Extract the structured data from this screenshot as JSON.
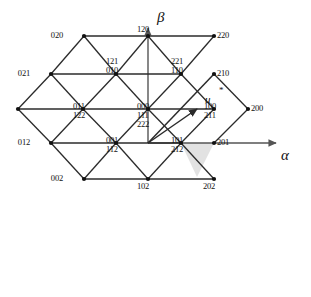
{
  "figure": {
    "type": "triangular-lattice-hexagon",
    "background_color": "#ffffff",
    "line_color": "#2b2b2b",
    "axis_color": "#555555",
    "shaded_sector_color": "#e2e2e2",
    "vertex_color": "#111111"
  },
  "axes": {
    "alpha": {
      "label": "α",
      "x": 281,
      "y": 182,
      "direction": "right"
    },
    "beta": {
      "label": "β",
      "x": 157,
      "y": 10,
      "direction": "up"
    }
  },
  "vector": {
    "label": "u",
    "superscript": "*",
    "label_x": 205,
    "label_y": 128,
    "star_x": 219,
    "star_y": 119,
    "from": [
      148,
      177
    ],
    "to": [
      197,
      143
    ]
  },
  "shaded_sector": {
    "points": "181,143 214,143 197,177",
    "vertices": [
      "110",
      "210",
      "100/211"
    ]
  },
  "lattice": {
    "center": [
      148,
      177
    ],
    "spacing_x": 33,
    "spacing_y": 34,
    "vertices": [
      {
        "id": "v-020",
        "x": 84,
        "y": 70,
        "labels": [
          "020"
        ],
        "lx": 63,
        "ly": 65,
        "align": "right"
      },
      {
        "id": "v-120",
        "x": 148,
        "y": 70,
        "labels": [
          "120"
        ],
        "lx": 137,
        "ly": 59,
        "align": "left"
      },
      {
        "id": "v-220",
        "x": 214,
        "y": 70,
        "labels": [
          "220"
        ],
        "lx": 217,
        "ly": 65,
        "align": "left"
      },
      {
        "id": "v-021",
        "x": 51,
        "y": 108,
        "labels": [
          "021"
        ],
        "lx": 30,
        "ly": 103,
        "align": "right"
      },
      {
        "id": "v-010",
        "x": 116,
        "y": 108,
        "labels": [
          "121",
          "010"
        ],
        "lx": 106,
        "ly": 91,
        "align": "left"
      },
      {
        "id": "v-110",
        "x": 181,
        "y": 108,
        "labels": [
          "221",
          "110"
        ],
        "lx": 171,
        "ly": 91,
        "align": "left"
      },
      {
        "id": "v-210",
        "x": 214,
        "y": 108,
        "labels": [
          "210"
        ],
        "lx": 217,
        "ly": 103,
        "align": "left"
      },
      {
        "id": "v-022",
        "x": 18,
        "y": 143,
        "labels": [
          "022"
        ],
        "lx": -2,
        "ly": 138,
        "align": "right"
      },
      {
        "id": "v-011",
        "x": 83,
        "y": 143,
        "labels": [
          "011",
          "122"
        ],
        "lx": 73,
        "ly": 136,
        "align": "left"
      },
      {
        "id": "v-000",
        "x": 148,
        "y": 143,
        "labels": [
          "000",
          "111",
          "222"
        ],
        "lx": 137,
        "ly": 136,
        "align": "left"
      },
      {
        "id": "v-100",
        "x": 214,
        "y": 143,
        "labels": [
          "100",
          "211"
        ],
        "lx": 204,
        "ly": 136,
        "align": "left"
      },
      {
        "id": "v-200",
        "x": 248,
        "y": 143,
        "labels": [
          "200"
        ],
        "lx": 251,
        "ly": 138,
        "align": "left"
      },
      {
        "id": "v-012",
        "x": 51,
        "y": 177,
        "labels": [
          "012"
        ],
        "lx": 30,
        "ly": 172,
        "align": "right"
      },
      {
        "id": "v-001",
        "x": 116,
        "y": 177,
        "labels": [
          "001",
          "112"
        ],
        "lx": 106,
        "ly": 170,
        "align": "left"
      },
      {
        "id": "v-101",
        "x": 181,
        "y": 177,
        "labels": [
          "101",
          "212"
        ],
        "lx": 171,
        "ly": 170,
        "align": "left"
      },
      {
        "id": "v-201",
        "x": 214,
        "y": 177,
        "labels": [
          "201"
        ],
        "lx": 217,
        "ly": 172,
        "align": "left"
      },
      {
        "id": "v-002",
        "x": 84,
        "y": 213,
        "labels": [
          "002"
        ],
        "lx": 63,
        "ly": 208,
        "align": "right"
      },
      {
        "id": "v-102",
        "x": 148,
        "y": 213,
        "labels": [
          "102"
        ],
        "lx": 137,
        "ly": 216,
        "align": "left"
      },
      {
        "id": "v-202",
        "x": 214,
        "y": 213,
        "labels": [
          "202"
        ],
        "lx": 203,
        "ly": 216,
        "align": "left"
      }
    ]
  },
  "vertex_label_groups": [
    {
      "name": "label-020",
      "lines": [
        "020"
      ]
    },
    {
      "name": "label-120",
      "lines": [
        "120"
      ]
    },
    {
      "name": "label-220",
      "lines": [
        "220"
      ]
    },
    {
      "name": "label-021",
      "lines": [
        "021"
      ]
    },
    {
      "name": "label-121-010",
      "lines": [
        "121",
        "010"
      ]
    },
    {
      "name": "label-221-110",
      "lines": [
        "221",
        "110"
      ]
    },
    {
      "name": "label-210",
      "lines": [
        "210"
      ]
    },
    {
      "name": "label-022",
      "lines": [
        "022"
      ]
    },
    {
      "name": "label-011-122",
      "lines": [
        "011",
        "122"
      ]
    },
    {
      "name": "label-000-111-222",
      "lines": [
        "000",
        "111",
        "222"
      ]
    },
    {
      "name": "label-100-211",
      "lines": [
        "100",
        "211"
      ]
    },
    {
      "name": "label-200",
      "lines": [
        "200"
      ]
    },
    {
      "name": "label-012",
      "lines": [
        "012"
      ]
    },
    {
      "name": "label-001-112",
      "lines": [
        "001",
        "112"
      ]
    },
    {
      "name": "label-101-212",
      "lines": [
        "101",
        "212"
      ]
    },
    {
      "name": "label-201",
      "lines": [
        "201"
      ]
    },
    {
      "name": "label-002",
      "lines": [
        "002"
      ]
    },
    {
      "name": "label-102",
      "lines": [
        "102"
      ]
    },
    {
      "name": "label-202",
      "lines": [
        "202"
      ]
    }
  ]
}
